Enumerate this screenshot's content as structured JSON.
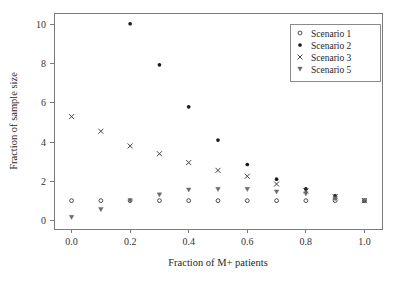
{
  "chart_data": {
    "type": "scatter",
    "title": "",
    "xlabel": "Fraction of M+ patients",
    "ylabel": "Fraction of sample size",
    "xlim": [
      -0.06,
      1.06
    ],
    "ylim": [
      -0.45,
      10.6
    ],
    "xticks": [
      0.0,
      0.2,
      0.4,
      0.6,
      0.8,
      1.0
    ],
    "xticklabels": [
      "0.0",
      "0.2",
      "0.4",
      "0.6",
      "0.8",
      "1.0"
    ],
    "yticks": [
      0,
      2,
      4,
      6,
      8,
      10
    ],
    "yticklabels": [
      "0",
      "2",
      "4",
      "6",
      "8",
      "10"
    ],
    "grid": false,
    "legend_position": "upper right",
    "x": [
      0.0,
      0.1,
      0.2,
      0.3,
      0.4,
      0.5,
      0.6,
      0.7,
      0.8,
      0.9,
      1.0
    ],
    "series": [
      {
        "name": "Scenario 1",
        "marker": "open-circle",
        "values": [
          1.0,
          1.0,
          1.0,
          1.0,
          1.0,
          1.0,
          1.0,
          1.0,
          1.0,
          1.0,
          1.0
        ]
      },
      {
        "name": "Scenario 2",
        "marker": "filled-circle",
        "values": [
          null,
          null,
          10.05,
          7.95,
          5.8,
          4.1,
          2.85,
          2.1,
          1.6,
          1.25,
          1.0
        ]
      },
      {
        "name": "Scenario 3",
        "marker": "cross",
        "values": [
          5.3,
          4.55,
          3.8,
          3.4,
          2.95,
          2.55,
          2.25,
          1.85,
          1.5,
          1.2,
          1.0
        ]
      },
      {
        "name": "Scenario 5",
        "marker": "triangle-down",
        "values": [
          0.15,
          0.55,
          1.0,
          1.3,
          1.55,
          1.58,
          1.58,
          1.45,
          1.35,
          1.1,
          1.0
        ]
      }
    ]
  },
  "legend": {
    "items": [
      {
        "label": "Scenario 1",
        "marker": "open-circle"
      },
      {
        "label": "Scenario 2",
        "marker": "filled-circle"
      },
      {
        "label": "Scenario 3",
        "marker": "cross"
      },
      {
        "label": "Scenario 5",
        "marker": "triangle-down"
      }
    ]
  },
  "colors": {
    "background": "#ffffff",
    "axis": "#7a7a7a",
    "marker_dark": "#1a1a1a",
    "marker_mid": "#3a3a3a",
    "marker_light": "#6a6a6a",
    "text": "#262626"
  }
}
